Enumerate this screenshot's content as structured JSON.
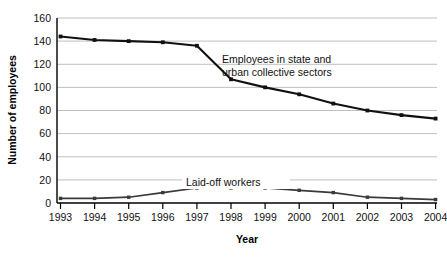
{
  "chart_data": {
    "type": "line",
    "title": "",
    "subtitle": "",
    "xlabel": "Year",
    "ylabel": "Number of employees",
    "categories": [
      "1993",
      "1994",
      "1995",
      "1996",
      "1997",
      "1998",
      "1999",
      "2000",
      "2001",
      "2002",
      "2003",
      "2004"
    ],
    "x": [
      1993,
      1994,
      1995,
      1996,
      1997,
      1998,
      1999,
      2000,
      2001,
      2002,
      2003,
      2004
    ],
    "xlim": [
      1993,
      2004
    ],
    "ylim": [
      0,
      160
    ],
    "yticks": [
      0,
      20,
      40,
      60,
      80,
      100,
      120,
      140,
      160
    ],
    "ytick_labels": [
      "0",
      "20",
      "40",
      "60",
      "80",
      "100",
      "120",
      "140",
      "160"
    ],
    "grid": "horizontal",
    "legend": "none (inline annotations)",
    "series": [
      {
        "name": "Employees in state and urban collective sectors",
        "values": [
          144,
          141,
          140,
          139,
          136,
          107,
          100,
          94,
          86,
          80,
          76,
          73
        ],
        "color": "#111111",
        "marker": "square"
      },
      {
        "name": "Laid-off workers",
        "values": [
          4,
          4,
          5,
          9,
          13,
          13,
          13,
          11,
          9,
          5,
          4,
          3
        ],
        "color": "#3a3a3a",
        "marker": "square"
      }
    ],
    "annotations": [
      {
        "id": "annotation-upper",
        "lines": [
          "Employees in state and",
          "urban collective sectors"
        ],
        "text": "Employees in state and urban collective sectors"
      },
      {
        "id": "annotation-lower",
        "lines": [
          "Laid-off workers"
        ],
        "text": "Laid-off workers"
      }
    ]
  },
  "axes": {
    "y_title": "Number of employees",
    "x_title": "Year"
  }
}
